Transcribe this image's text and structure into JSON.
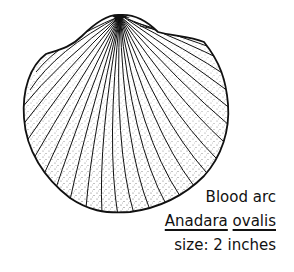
{
  "illustration": {
    "subject": "shell-drawing",
    "ink_color": "#111111",
    "background": "#ffffff"
  },
  "caption": {
    "common_name": "Blood arc",
    "genus": "Anadara",
    "species": "ovalis",
    "size_label": "size: 2 inches"
  }
}
